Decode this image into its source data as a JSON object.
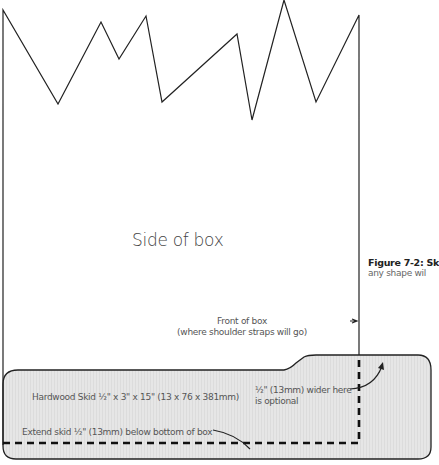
{
  "diagram": {
    "box_label": "Side of box",
    "front_label_line1": "Front of box",
    "front_label_line2": "(where shoulder straps will go)",
    "skid_label": "Hardwood Skid ½\" x 3\" x 15\" (13 x 76 x 381mm)",
    "wider_label_line1": "½\" (13mm) wider here",
    "wider_label_line2": "is optional",
    "extend_label": "Extend skid ½\" (13mm) below bottom of box"
  },
  "caption": {
    "title": "Figure 7-2: Sk",
    "subtitle": "any shape wil"
  },
  "colors": {
    "line": "#222222",
    "skid_fill": "#e4e4e4",
    "text": "#555555"
  }
}
